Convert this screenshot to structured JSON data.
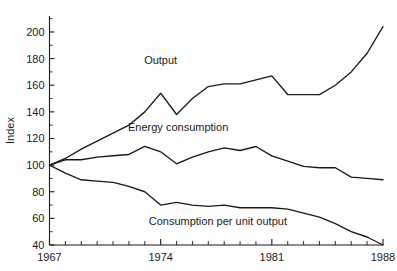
{
  "chart_data": {
    "type": "line",
    "title": "",
    "xlabel": "",
    "ylabel": "Index",
    "xlim": [
      1967,
      1988
    ],
    "ylim": [
      40,
      212
    ],
    "grid": false,
    "legend_position": "inline-annotations",
    "x": [
      1967,
      1968,
      1969,
      1970,
      1971,
      1972,
      1973,
      1974,
      1975,
      1976,
      1977,
      1978,
      1979,
      1980,
      1981,
      1982,
      1983,
      1984,
      1985,
      1986,
      1987,
      1988
    ],
    "y_ticks": [
      40,
      60,
      80,
      100,
      120,
      140,
      160,
      180,
      200
    ],
    "y_tick_labels": [
      "40",
      "60",
      "80",
      "100",
      "120",
      "140",
      "160",
      "180",
      "200"
    ],
    "y_minor_step": 10,
    "x_ticks": [
      1967,
      1968,
      1969,
      1970,
      1971,
      1972,
      1973,
      1974,
      1975,
      1976,
      1977,
      1978,
      1979,
      1980,
      1981,
      1982,
      1983,
      1984,
      1985,
      1986,
      1987,
      1988
    ],
    "x_tick_labels_shown": [
      "1967",
      "1974",
      "1981",
      "1988"
    ],
    "x_labeled_ticks": [
      1967,
      1974,
      1981,
      1988
    ],
    "series": [
      {
        "name": "Output",
        "label": "Output",
        "label_x": 1974.0,
        "label_y": 176,
        "values": [
          100,
          105,
          112,
          118,
          124,
          130,
          140,
          154,
          138,
          150,
          159,
          161,
          161,
          164,
          167,
          153,
          153,
          153,
          160,
          170,
          184,
          204
        ]
      },
      {
        "name": "Energy consumption",
        "label": "Energy consumption",
        "label_x": 1975.1,
        "label_y": 126,
        "values": [
          100,
          104,
          104,
          106,
          107,
          108,
          114,
          110,
          101,
          106,
          110,
          113,
          111,
          114,
          107,
          103,
          99,
          98,
          98,
          91,
          90,
          89
        ]
      },
      {
        "name": "Consumption per unit output",
        "label": "Consumption per unit output",
        "label_x": 1977.6,
        "label_y": 55,
        "values": [
          100,
          94,
          89,
          88,
          87,
          84,
          80,
          70,
          72,
          70,
          69,
          70,
          68,
          68,
          68,
          67,
          64,
          61,
          56,
          50,
          46,
          40
        ]
      }
    ]
  }
}
